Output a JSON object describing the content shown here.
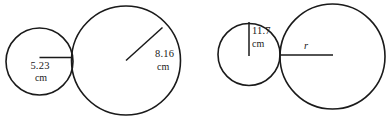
{
  "figure": {
    "stroke_color": "#1a1a1a",
    "background_color": "#ffffff",
    "diagrams": [
      {
        "name": "left-diagram",
        "small_circle": {
          "label_value": "5.23",
          "label_unit": "cm",
          "measure_type": "radius"
        },
        "large_circle": {
          "label_value": "8.16",
          "label_unit": "cm",
          "measure_type": "radius"
        }
      },
      {
        "name": "right-diagram",
        "small_circle": {
          "label_value": "11.7",
          "label_unit": "cm",
          "measure_type": "radius"
        },
        "large_circle": {
          "label_value": "r",
          "label_unit": "",
          "measure_type": "radius"
        }
      }
    ],
    "caption": ""
  }
}
